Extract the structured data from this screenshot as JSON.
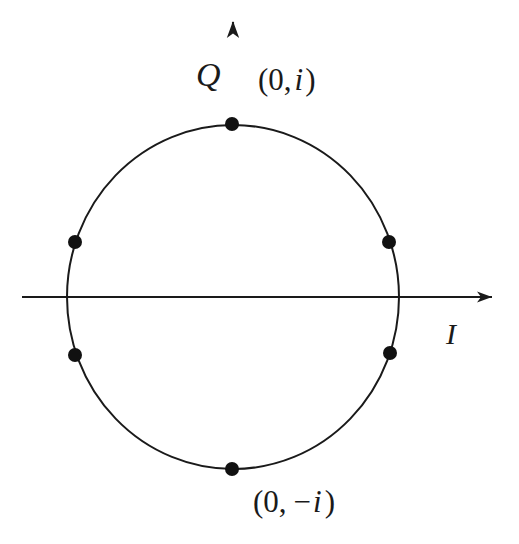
{
  "figure": {
    "kind": "constellation-diagram",
    "title": "",
    "background_color": "#ffffff",
    "stroke_color": "#1a1a1a",
    "point_color": "#111111"
  },
  "axes": {
    "horizontal": {
      "label": "I",
      "name": "in-phase-axis",
      "x_start": 22,
      "x_end": 498,
      "y": 297,
      "has_arrow": true,
      "label_x": 446,
      "label_y": 344
    },
    "vertical": {
      "label": "Q",
      "name": "quadrature-axis",
      "y_start": 22,
      "y_end": 515,
      "x": 233,
      "has_arrow": true,
      "label_x": 196,
      "label_y": 86
    }
  },
  "chart_data": {
    "type": "scatter",
    "title": "",
    "xlabel": "I",
    "ylabel": "Q",
    "grid": false,
    "legend": null,
    "unit_circle": {
      "center_x": 233,
      "center_y": 297,
      "radius_x": 166,
      "radius_y": 172
    },
    "xlim": [
      -1.43,
      1.6
    ],
    "ylim": [
      -1.6,
      1.6
    ],
    "points": [
      {
        "id": "p-top",
        "label": "(0, i)",
        "i": 0.0,
        "q": 1.0,
        "px": 232,
        "py": 124
      },
      {
        "id": "p-upper-right",
        "label": "",
        "i": 0.94,
        "q": 0.32,
        "px": 389,
        "py": 242
      },
      {
        "id": "p-lower-right",
        "label": "",
        "i": 0.95,
        "q": -0.33,
        "px": 390,
        "py": 353
      },
      {
        "id": "p-bottom",
        "label": "(0, -i)",
        "i": 0.0,
        "q": -1.0,
        "px": 232,
        "py": 469
      },
      {
        "id": "p-lower-left",
        "label": "",
        "i": -0.95,
        "q": -0.34,
        "px": 75,
        "py": 355
      },
      {
        "id": "p-upper-left",
        "label": "",
        "i": -0.95,
        "q": 0.32,
        "px": 75,
        "py": 242
      }
    ],
    "point_radius": 7,
    "annotations": [
      {
        "id": "ann-top",
        "name": "label-zero-i",
        "open_paren": "(",
        "zero": "0",
        "comma": ",",
        "imag": "i",
        "minus": "",
        "close_paren": ")",
        "full_text": "(0, i)",
        "x": 258,
        "y": 90
      },
      {
        "id": "ann-bottom",
        "name": "label-zero-minus-i",
        "open_paren": "(",
        "zero": "0",
        "comma": ",",
        "imag": "i",
        "minus": "−",
        "close_paren": ")",
        "full_text": "(0, −i)",
        "x": 253,
        "y": 512
      }
    ]
  }
}
